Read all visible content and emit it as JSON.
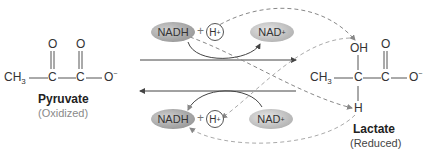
{
  "pyruvate": {
    "ch3": "CH",
    "ch3_sub": "3",
    "c1": "C",
    "c2": "C",
    "o_double_1": "O",
    "o_double_2": "O",
    "o_minus": "O",
    "o_minus_charge": "−",
    "name": "Pyruvate",
    "state": "(Oxidized)"
  },
  "lactate": {
    "ch3": "CH",
    "ch3_sub": "3",
    "c1": "C",
    "c2": "C",
    "oh": "OH",
    "o_double": "O",
    "o_minus": "O",
    "o_minus_charge": "−",
    "h": "H",
    "name": "Lactate",
    "state": "(Reduced)"
  },
  "forward": {
    "nadh": "NADH",
    "plus": "+",
    "h": "H",
    "h_charge": "+",
    "nad": "NAD",
    "nad_charge": "+"
  },
  "reverse": {
    "nadh": "NADH",
    "plus": "+",
    "h": "H",
    "h_charge": "+",
    "nad": "NAD",
    "nad_charge": "+"
  },
  "colors": {
    "bond": "#555555",
    "arrow": "#444444",
    "dashed": "#888888",
    "dashed_light": "#aaaaaa"
  }
}
